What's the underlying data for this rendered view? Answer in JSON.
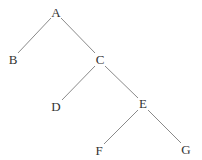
{
  "diagram": {
    "type": "binary-tree",
    "colors": {
      "edge": "#8a8a8a",
      "label": "#333333",
      "background": "#ffffff"
    },
    "nodes": [
      {
        "id": "A",
        "label": "A",
        "x": 56,
        "y": 13
      },
      {
        "id": "B",
        "label": "B",
        "x": 13,
        "y": 60
      },
      {
        "id": "C",
        "label": "C",
        "x": 100,
        "y": 60
      },
      {
        "id": "D",
        "label": "D",
        "x": 56,
        "y": 107
      },
      {
        "id": "E",
        "label": "E",
        "x": 143,
        "y": 104
      },
      {
        "id": "F",
        "label": "F",
        "x": 99,
        "y": 151
      },
      {
        "id": "G",
        "label": "G",
        "x": 186,
        "y": 150
      }
    ],
    "edges": [
      {
        "from": "A",
        "to": "B"
      },
      {
        "from": "A",
        "to": "C"
      },
      {
        "from": "C",
        "to": "D"
      },
      {
        "from": "C",
        "to": "E"
      },
      {
        "from": "E",
        "to": "F"
      },
      {
        "from": "E",
        "to": "G"
      }
    ]
  }
}
